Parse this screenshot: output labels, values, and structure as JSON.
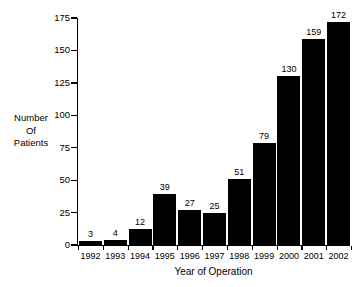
{
  "chart_data": {
    "type": "bar",
    "title": "",
    "subtitle": "",
    "xlabel": "Year of Operation",
    "ylabel": "Number Of Patients",
    "ylabel_lines": [
      "Number",
      "Of",
      "Patients"
    ],
    "categories": [
      "1992",
      "1993",
      "1994",
      "1995",
      "1996",
      "1997",
      "1998",
      "1999",
      "2000",
      "2001",
      "2002"
    ],
    "values": [
      3,
      4,
      12,
      39,
      27,
      25,
      51,
      79,
      130,
      159,
      172
    ],
    "data_labels": [
      "3",
      "4",
      "12",
      "39",
      "27",
      "25",
      "51",
      "79",
      "130",
      "159",
      "172"
    ],
    "ylim": [
      0,
      175
    ],
    "ytick_values": [
      0,
      25,
      50,
      75,
      100,
      125,
      150,
      175
    ],
    "ytick_labels": [
      "0",
      "25",
      "50",
      "75",
      "100",
      "125",
      "150",
      "175"
    ],
    "grid": false,
    "legend": null,
    "legend_position": "none",
    "bar_color": "#000000",
    "axis_color": "#000000",
    "background_color": "#ffffff",
    "annotations": []
  }
}
